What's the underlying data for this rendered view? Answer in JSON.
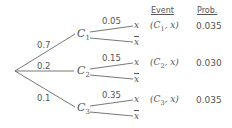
{
  "headers": {
    "event": "Event",
    "prob": "Prob."
  },
  "root_edges": [
    {
      "label": "0.7",
      "node": "C",
      "sub": "1"
    },
    {
      "label": "0.2",
      "node": "C",
      "sub": "2"
    },
    {
      "label": "0.1",
      "node": "C",
      "sub": "3"
    }
  ],
  "branches": [
    {
      "label": "0.05",
      "leaf_x": "x",
      "leaf_notx": "x",
      "event_node": "C",
      "event_sub": "1",
      "event_var": "x",
      "prob": "0.035"
    },
    {
      "label": "0.15",
      "leaf_x": "x",
      "leaf_notx": "x",
      "event_node": "C",
      "event_sub": "2",
      "event_var": "x",
      "prob": "0.030"
    },
    {
      "label": "0.35",
      "leaf_x": "x",
      "leaf_notx": "x",
      "event_node": "C",
      "event_sub": "3",
      "event_var": "x",
      "prob": "0.035"
    }
  ]
}
